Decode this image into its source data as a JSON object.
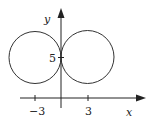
{
  "diagram": {
    "type": "coordinate-plane-curve",
    "axes": {
      "x_label": "x",
      "y_label": "y",
      "x_ticks": [
        {
          "value": -3,
          "label": "−3"
        },
        {
          "value": 3,
          "label": "3"
        }
      ],
      "y_ticks": [
        {
          "value": 5,
          "label": "5"
        }
      ]
    },
    "curves": [
      {
        "name": "left-circle",
        "center": [
          -3,
          5
        ],
        "radius": 3
      },
      {
        "name": "right-circle",
        "center": [
          3,
          5
        ],
        "radius": 3
      }
    ],
    "colors": {
      "stroke": "#333333",
      "axis": "#222222",
      "background": "#ffffff"
    }
  }
}
